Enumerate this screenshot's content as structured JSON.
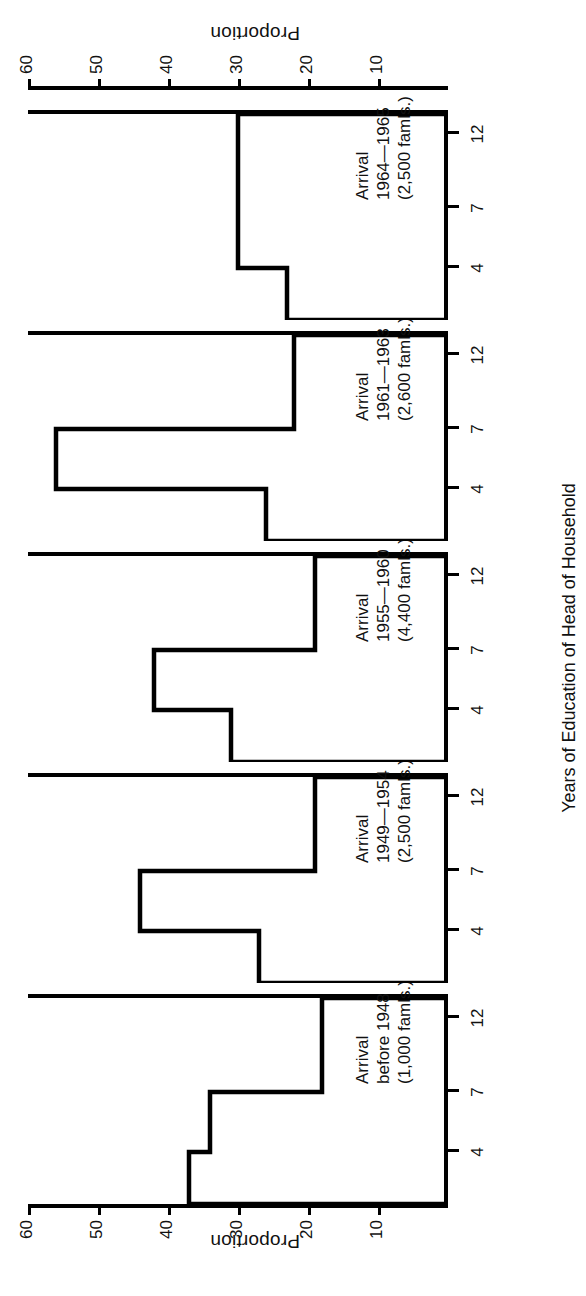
{
  "chart_data": {
    "type": "bar",
    "title": "",
    "xlabel": "Years of Education of Head of Household",
    "ylabel": "Proportion",
    "ylim": [
      0,
      60
    ],
    "yticks": [
      0,
      10,
      20,
      30,
      40,
      50,
      60
    ],
    "ytick_labels": [
      "",
      "10",
      "20",
      "30",
      "40",
      "50",
      "60"
    ],
    "xticks": [
      4,
      7,
      12
    ],
    "xtick_labels": [
      "4",
      "7",
      "12"
    ],
    "grid": false,
    "legend": "none",
    "orientation": "page-rotated-90-ccw",
    "categories": [
      "0-4",
      "5-7",
      "8-12",
      "12+"
    ],
    "panels": [
      {
        "caption_lines": [
          "Arrival",
          "before 1948",
          "(1,000 famls.)"
        ],
        "arrival": "before 1948",
        "families": "1,000 famls.",
        "values": [
          37,
          34,
          18,
          18
        ]
      },
      {
        "caption_lines": [
          "Arrival",
          "1949—1954",
          "(2,500 famls.)"
        ],
        "arrival": "1949—1954",
        "families": "2,500 famls.",
        "values": [
          27,
          44,
          19,
          19
        ]
      },
      {
        "caption_lines": [
          "Arrival",
          "1955—1960",
          "(4,400 famls.)"
        ],
        "arrival": "1955—1960",
        "families": "4,400 famls.",
        "values": [
          31,
          42,
          19,
          19
        ]
      },
      {
        "caption_lines": [
          "Arrival",
          "1961—1963",
          "(2,600 famls.)"
        ],
        "arrival": "1961—1963",
        "families": "2,600 famls.",
        "values": [
          26,
          56,
          22,
          22
        ]
      },
      {
        "caption_lines": [
          "Arrival",
          "1964—1965",
          "(2,500 famls.)"
        ],
        "arrival": "1964—1965",
        "families": "2,500 famls.",
        "values": [
          23,
          30,
          30,
          30
        ]
      }
    ]
  },
  "axis": {
    "proportion_label_left": "Proportion",
    "proportion_label_right": "Proportion",
    "education_label": "Years of Education of Head of Household",
    "y_labels": [
      "60",
      "50",
      "40",
      "30",
      "20",
      "10"
    ],
    "x_labels": [
      "4",
      "7",
      "12"
    ]
  },
  "colors": {
    "ink": "#000000",
    "paper": "#ffffff"
  }
}
